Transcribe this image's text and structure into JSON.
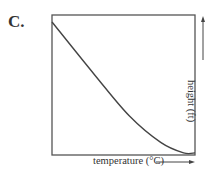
{
  "panel_label": "C.",
  "chart_data": {
    "type": "line",
    "title": "",
    "xlabel": "temperature (°C)",
    "ylabel": "height (ft)",
    "axis_arrows": true,
    "grid": false,
    "ticks": false,
    "series": [
      {
        "name": "curve",
        "x": [
          0,
          0.3,
          0.54,
          0.76,
          0.92,
          1.0
        ],
        "y": [
          0.95,
          0.57,
          0.28,
          0.09,
          0.015,
          0.015
        ]
      }
    ],
    "xlim": [
      0,
      1
    ],
    "ylim": [
      0,
      1
    ]
  },
  "colors": {
    "line": "#444444",
    "frame": "#555555",
    "text": "#333333"
  }
}
